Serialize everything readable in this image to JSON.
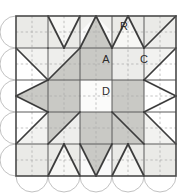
{
  "figure": {
    "width": 192,
    "height": 194
  },
  "labels": {
    "r": "R",
    "a": "A",
    "c": "C",
    "d": "D"
  },
  "colors": {
    "background": "#ffffff",
    "light": "#f4f4f2",
    "pale": "#fafafa",
    "medium_light": "#e3e3e0",
    "medium": "#c9c9c5",
    "dark": "#bdbdb9",
    "white_piece": "#ffffff",
    "outline": "#4a4a4a",
    "seam_line": "#9a9a9a",
    "scallop": "#c0c0c0"
  },
  "geometry": {
    "block_left": 16,
    "block_top": 16,
    "block_size": 160,
    "grid_divisions": 5,
    "cell_size": 32,
    "scallop_radius": 16
  },
  "label_positions": {
    "r": {
      "x": 124,
      "y": 27
    },
    "a": {
      "x": 106,
      "y": 60
    },
    "c": {
      "x": 144,
      "y": 60
    },
    "d": {
      "x": 106,
      "y": 92
    }
  },
  "structure": {
    "description": "Five by five patchwork grid forming a central star with corner squares, flying-geese triangles and a scalloped border on the left and bottom edges.",
    "edges_with_scallops": [
      "left",
      "bottom"
    ],
    "edges_plain": [
      "top",
      "right"
    ]
  }
}
